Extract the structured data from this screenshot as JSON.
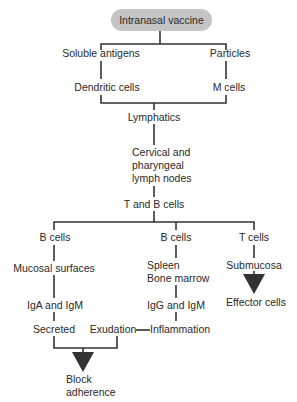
{
  "diagram": {
    "type": "flowchart",
    "root": "Intranasal vaccine",
    "nodes": {
      "soluble_antigens": "Soluble antigens",
      "particles": "Particles",
      "dendritic_cells": "Dendritic cells",
      "m_cells": "M cells",
      "lymphatics": "Lymphatics",
      "lymph_nodes_1": "Cervical and",
      "lymph_nodes_2": "pharyngeal",
      "lymph_nodes_3": "lymph nodes",
      "t_and_b_cells": "T and B cells",
      "b_cells_left": "B cells",
      "b_cells_mid": "B cells",
      "t_cells": "T cells",
      "mucosal_surfaces": "Mucosal surfaces",
      "spleen": "Spleen",
      "bone_marrow": "Bone marrow",
      "submucosa": "Submucosa",
      "iga_igm": "IgA and IgM",
      "igg_igm": "IgG and IgM",
      "effector_cells": "Effector cells",
      "secreted": "Secreted",
      "exudation": "Exudation",
      "inflammation": "Inflammation",
      "block_1": "Block",
      "block_2": "adherence"
    },
    "edges": [
      [
        "Intranasal vaccine",
        "Soluble antigens"
      ],
      [
        "Intranasal vaccine",
        "Particles"
      ],
      [
        "Soluble antigens",
        "Dendritic cells"
      ],
      [
        "Particles",
        "M cells"
      ],
      [
        "Dendritic cells",
        "Lymphatics"
      ],
      [
        "M cells",
        "Lymphatics"
      ],
      [
        "Lymphatics",
        "Cervical and pharyngeal lymph nodes"
      ],
      [
        "Cervical and pharyngeal lymph nodes",
        "T and B cells"
      ],
      [
        "T and B cells",
        "B cells (mucosal)"
      ],
      [
        "T and B cells",
        "B cells (systemic)"
      ],
      [
        "T and B cells",
        "T cells"
      ],
      [
        "B cells (mucosal)",
        "Mucosal surfaces"
      ],
      [
        "Mucosal surfaces",
        "IgA and IgM"
      ],
      [
        "IgA and IgM",
        "Secreted"
      ],
      [
        "B cells (systemic)",
        "Spleen Bone marrow"
      ],
      [
        "Spleen Bone marrow",
        "IgG and IgM"
      ],
      [
        "IgG and IgM",
        "Inflammation"
      ],
      [
        "Inflammation",
        "Exudation"
      ],
      [
        "T cells",
        "Submucosa"
      ],
      [
        "Submucosa",
        "Effector cells"
      ],
      [
        "Secreted",
        "Block adherence"
      ],
      [
        "Exudation",
        "Block adherence"
      ]
    ]
  },
  "colors": {
    "box_fill": "#c4c4c4",
    "line": "#333333",
    "arrow": "#333333"
  }
}
